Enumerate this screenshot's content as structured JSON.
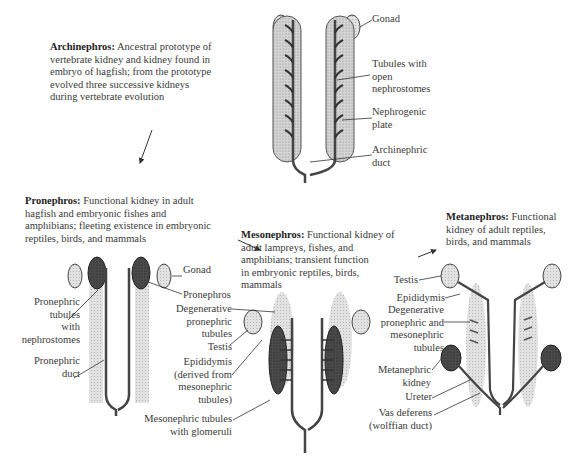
{
  "archinephros": {
    "title": "Archinephros:",
    "desc_lines": [
      "Ancestral prototype of",
      "vertebrate kidney and kidney found in",
      "embryo of hagfish; from the prototype",
      "evolved three successive kidneys",
      "during vertebrate evolution"
    ],
    "labels": {
      "gonad": "Gonad",
      "tubules_1": "Tubules with",
      "tubules_2": "open",
      "tubules_3": "nephrostomes",
      "plate_1": "Nephrogenic",
      "plate_2": "plate",
      "duct_1": "Archinephric",
      "duct_2": "duct"
    }
  },
  "pronephros": {
    "title": "Pronephros:",
    "desc_lines": [
      "Functional kidney in adult",
      "hagfish and embryonic fishes and",
      "amphibians; fleeting existence in embryonic",
      "reptiles, birds, and mammals"
    ],
    "labels": {
      "gonad": "Gonad",
      "pronephros": "Pronephros",
      "tubules_1": "Pronephric",
      "tubules_2": "tubules",
      "tubules_3": "with",
      "tubules_4": "nephrostomes",
      "duct_1": "Pronephric",
      "duct_2": "duct"
    }
  },
  "mesonephros": {
    "title": "Mesonephros:",
    "desc_lines": [
      "Functional kidney of",
      "adult lampreys, fishes, and",
      "amphibians; transient function",
      "in embryonic reptiles, birds,",
      "mammals"
    ],
    "labels": {
      "degen_1": "Degenerative",
      "degen_2": "pronephric",
      "degen_3": "tubules",
      "testis": "Testis",
      "epi_1": "Epididymis",
      "epi_2": "(derived from",
      "epi_3": "mesonephric",
      "epi_4": "tubules)",
      "meso_1": "Mesonephric tubules",
      "meso_2": "with glomeruli"
    }
  },
  "metanephros": {
    "title": "Metanephros:",
    "desc_lines": [
      "Functional",
      "kidney of adult reptiles,",
      "birds, and mammals"
    ],
    "labels": {
      "testis": "Testis",
      "epididymis": "Epididymis",
      "degen_1": "Degenerative",
      "degen_2": "pronephric and",
      "degen_3": "mesonephric",
      "degen_4": "tubules",
      "kidney_1": "Metanephric",
      "kidney_2": "kidney",
      "ureter": "Ureter",
      "vas_1": "Vas deferens",
      "vas_2": "(wolffian duct)"
    }
  },
  "colors": {
    "stipple": "#c8c8c8",
    "dark": "#3c3c3c",
    "duct": "#555555",
    "text": "#3a3a3a"
  }
}
